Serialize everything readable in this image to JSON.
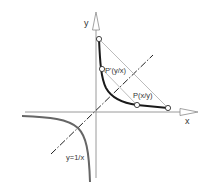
{
  "diagram": {
    "axes": {
      "x_label": "x",
      "y_label": "y"
    },
    "curve_label": "y=1/x",
    "points": {
      "p": "P(x/y)",
      "p_prime": "P'(y/x)"
    },
    "colors": {
      "axis": "#999999",
      "curve_positive": "#1a1a1a",
      "curve_negative": "#666666",
      "helper_lines": "#aaaaaa",
      "diagonal": "#1a1a1a"
    }
  }
}
